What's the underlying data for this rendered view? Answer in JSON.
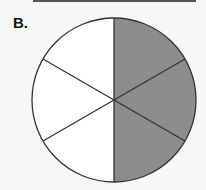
{
  "figure": {
    "label": "B.",
    "shape": "circle",
    "total_parts": 6,
    "shaded_parts": 3,
    "shaded_color": "#8c8c8c",
    "unshaded_color": "#ffffff",
    "line_color": "#333333"
  }
}
